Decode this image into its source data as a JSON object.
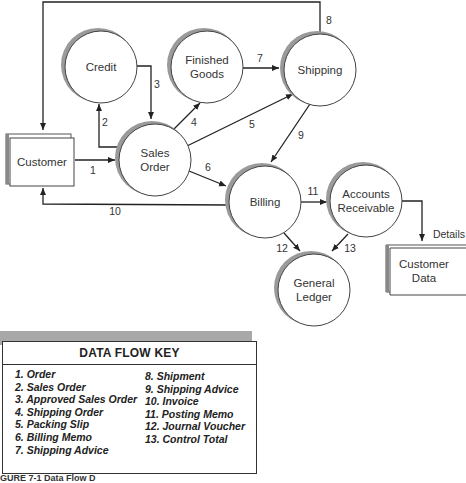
{
  "nodes": {
    "customer": {
      "label": "Customer",
      "type": "external-entity"
    },
    "credit": {
      "label": "Credit",
      "type": "process"
    },
    "finished_goods": {
      "label_line1": "Finished",
      "label_line2": "Goods",
      "type": "process"
    },
    "shipping": {
      "label": "Shipping",
      "type": "process"
    },
    "sales_order": {
      "label_line1": "Sales",
      "label_line2": "Order",
      "type": "process"
    },
    "billing": {
      "label": "Billing",
      "type": "process"
    },
    "accounts_receivable": {
      "label_line1": "Accounts",
      "label_line2": "Receivable",
      "type": "process"
    },
    "general_ledger": {
      "label_line1": "General",
      "label_line2": "Ledger",
      "type": "process"
    },
    "customer_data": {
      "label_line1": "Customer",
      "label_line2": "Data",
      "type": "data-store"
    }
  },
  "flows": [
    {
      "id": "1",
      "from": "Customer",
      "to": "Sales Order"
    },
    {
      "id": "2",
      "from": "Sales Order",
      "to": "Credit"
    },
    {
      "id": "3",
      "from": "Credit",
      "to": "Sales Order"
    },
    {
      "id": "4",
      "from": "Sales Order",
      "to": "Finished Goods"
    },
    {
      "id": "5",
      "from": "Sales Order",
      "to": "Shipping"
    },
    {
      "id": "6",
      "from": "Sales Order",
      "to": "Billing"
    },
    {
      "id": "7",
      "from": "Finished Goods",
      "to": "Shipping"
    },
    {
      "id": "8",
      "from": "Shipping",
      "to": "Customer"
    },
    {
      "id": "9",
      "from": "Shipping",
      "to": "Billing"
    },
    {
      "id": "10",
      "from": "Billing",
      "to": "Customer"
    },
    {
      "id": "11",
      "from": "Billing",
      "to": "Accounts Receivable"
    },
    {
      "id": "12",
      "from": "Billing",
      "to": "General Ledger"
    },
    {
      "id": "13",
      "from": "Accounts Receivable",
      "to": "General Ledger"
    },
    {
      "id": "Details",
      "from": "Accounts Receivable",
      "to": "Customer Data"
    }
  ],
  "key": {
    "title": "DATA FLOW KEY",
    "left_items": [
      "1. Order",
      "2. Sales Order",
      "3. Approved Sales Order",
      "4. Shipping Order",
      "5. Packing Slip",
      "6. Billing Memo",
      "7. Shipping Advice"
    ],
    "right_items": [
      "8. Shipment",
      "9. Shipping Advice",
      "10. Invoice",
      "11. Posting Memo",
      "12. Journal Voucher",
      "13. Control Total"
    ]
  },
  "caption": "GURE 7-1  Data Flow D"
}
